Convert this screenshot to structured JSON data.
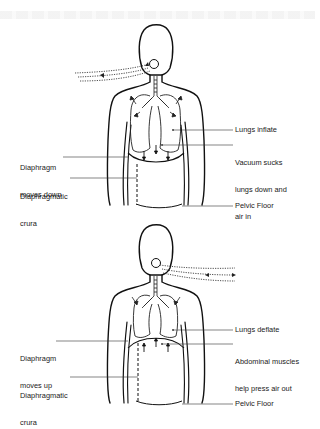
{
  "figures": [
    {
      "id": "inhale",
      "airflow_direction": "in",
      "labels": {
        "right_1": "Lungs inflate",
        "right_2_line1": "Vacuum sucks",
        "right_2_line2": "lungs down and",
        "right_2_line3": "air in",
        "right_3": "Pelvic Floor",
        "left_1_line1": "Diaphragm",
        "left_1_line2": "moves down",
        "left_2_line1": "Diaphragmatic",
        "left_2_line2": "crura"
      }
    },
    {
      "id": "exhale",
      "airflow_direction": "out",
      "labels": {
        "right_1": "Lungs deflate",
        "right_2_line1": "Abdominal muscles",
        "right_2_line2": "help press air out",
        "right_3": "Pelvic Floor",
        "left_1_line1": "Diaphragm",
        "left_1_line2": "moves up",
        "left_2_line1": "Diaphragmatic",
        "left_2_line2": "crura"
      }
    }
  ],
  "colors": {
    "line": "#111111",
    "leader": "#333333",
    "background": "#ffffff"
  }
}
